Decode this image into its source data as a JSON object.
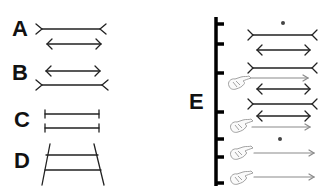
{
  "panels": {
    "labels": [
      {
        "id": "A",
        "text": "A"
      },
      {
        "id": "B",
        "text": "B"
      },
      {
        "id": "C",
        "text": "C"
      },
      {
        "id": "D",
        "text": "D"
      },
      {
        "id": "E",
        "text": "E"
      }
    ],
    "figures": {
      "A": [
        "line-fins-out",
        "line-arrowheads-in"
      ],
      "B": [
        "line-arrowheads-in",
        "line-fins-out"
      ],
      "C": [
        "line-end-ticks",
        "line-end-ticks"
      ],
      "D": [
        "ponzo-converging-rails-two-horizontal-lines"
      ],
      "E": {
        "axis": "vertical-bar-with-left-ticks",
        "rows": [
          "fixation-dot",
          "fins-out-line",
          "arrowheads-line",
          "fins-out-line + pointing-hand",
          "gray-arrow",
          "arrowheads-line",
          "fins-out-line",
          "arrowheads-line + pointing-hand",
          "gray-arrow",
          "fixation-dot",
          "gray-arrow + pointing-hand",
          "gray-arrow + pointing-hand"
        ]
      }
    },
    "colors": {
      "ink": "#222222",
      "light_ink": "#8a8a8a",
      "axis": "#000000"
    }
  }
}
